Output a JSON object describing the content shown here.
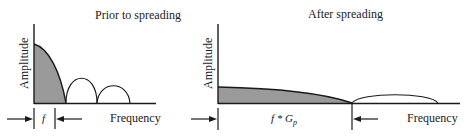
{
  "panels": [
    {
      "title": "Prior to spreading",
      "y_axis_label": "Amplitude",
      "x_axis_label": "Frequency",
      "bandwidth_label": "f",
      "lobes": [
        {
          "name": "main-lobe",
          "filled": true
        },
        {
          "name": "side-lobe-1",
          "filled": false
        },
        {
          "name": "side-lobe-2",
          "filled": false
        }
      ]
    },
    {
      "title": "After spreading",
      "y_axis_label": "Amplitude",
      "x_axis_label": "Frequency",
      "bandwidth_label_base": "f * G",
      "bandwidth_label_sub": "p",
      "lobes": [
        {
          "name": "spread-main-lobe",
          "filled": true
        },
        {
          "name": "spread-side-lobe",
          "filled": false
        }
      ]
    }
  ],
  "colors": {
    "fill": "#9a9a9a",
    "stroke": "#1a1a1a",
    "background": "#ffffff"
  }
}
